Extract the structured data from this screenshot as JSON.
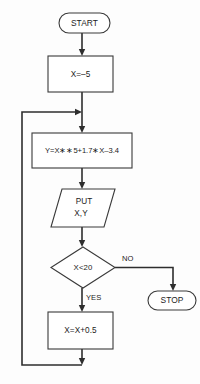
{
  "diagram": {
    "colors": {
      "background": "#fdfdfd",
      "shape_fill": "#ffffff",
      "shape_stroke": "#3a3a3a",
      "connector": "#2e2e2e",
      "text": "#1c1c1c"
    },
    "nodes": {
      "start": {
        "type": "terminal",
        "label": "START"
      },
      "init": {
        "type": "process",
        "label": "X=–5"
      },
      "compute": {
        "type": "process",
        "label": "Y=X∗∗5+1.7∗X–3.4"
      },
      "output": {
        "type": "input-output",
        "label_line1": "PUT",
        "label_line2": "X,Y"
      },
      "decision": {
        "type": "decision",
        "label": "X<20"
      },
      "increment": {
        "type": "process",
        "label": "X=X+0.5"
      },
      "stop": {
        "type": "terminal",
        "label": "STOP"
      }
    },
    "edge_labels": {
      "no": "NO",
      "yes": "YES"
    }
  }
}
